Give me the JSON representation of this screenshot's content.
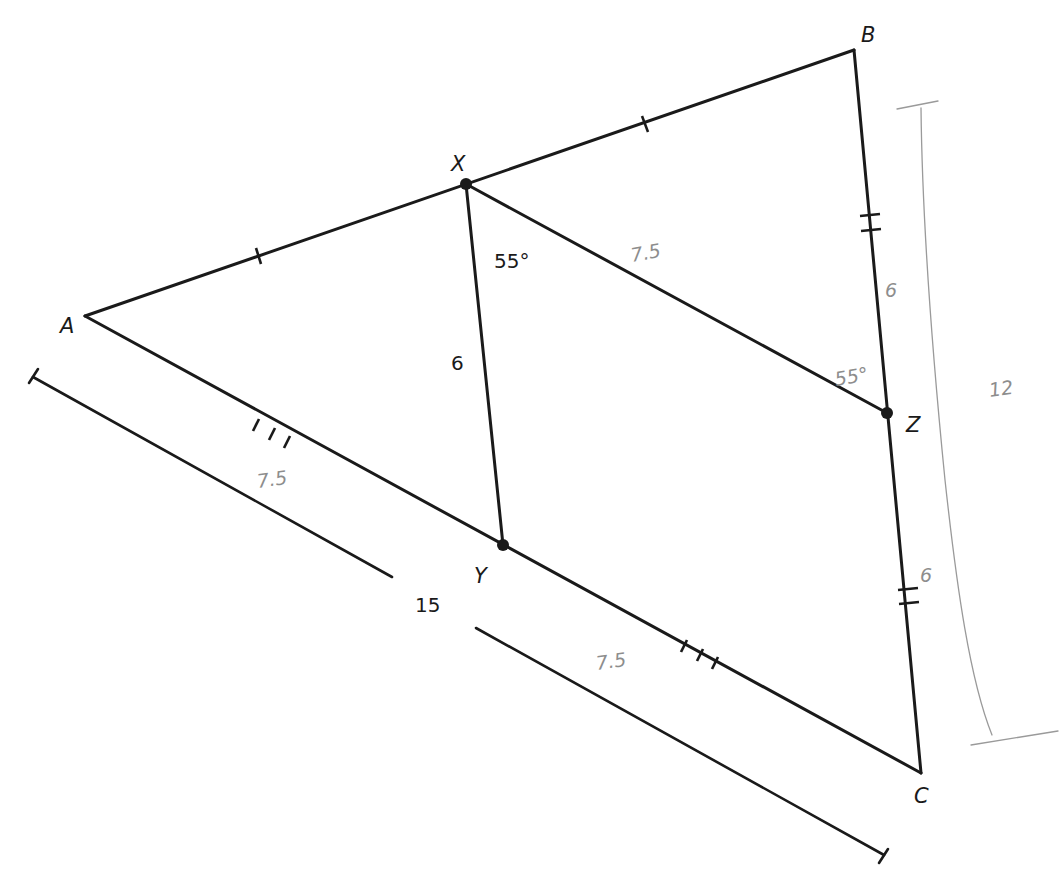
{
  "diagram": {
    "vertices": {
      "A": {
        "label": "A",
        "x": 85,
        "y": 316
      },
      "B": {
        "label": "B",
        "x": 854,
        "y": 50
      },
      "C": {
        "label": "C",
        "x": 921,
        "y": 773
      }
    },
    "points": {
      "X": {
        "label": "X",
        "x": 466,
        "y": 184
      },
      "Y": {
        "label": "Y",
        "x": 503,
        "y": 545
      },
      "Z": {
        "label": "Z",
        "x": 887,
        "y": 413
      }
    },
    "segments": [
      {
        "from": "A",
        "to": "B",
        "tick_marks": 1,
        "note": "X is midpoint"
      },
      {
        "from": "B",
        "to": "C",
        "tick_marks": 2,
        "note": "Z is midpoint"
      },
      {
        "from": "A",
        "to": "C",
        "tick_marks": 3,
        "note": "Y is midpoint"
      },
      {
        "from": "X",
        "to": "Y",
        "length_label": "6"
      },
      {
        "from": "X",
        "to": "Z",
        "length_label": "7.5"
      }
    ],
    "printed_labels": {
      "angle_x": "55°",
      "xy_length": "6",
      "ac_length": "15"
    },
    "handwritten_labels": {
      "xz_length": "7.5",
      "angle_z": "55°",
      "bz_length": "6",
      "zc_length": "6",
      "bc_length": "12",
      "ay_length": "7.5",
      "yc_length": "7.5"
    },
    "colors": {
      "ink": "#1a1a1a",
      "pencil": "#9a9a9a",
      "background": "#ffffff"
    }
  }
}
